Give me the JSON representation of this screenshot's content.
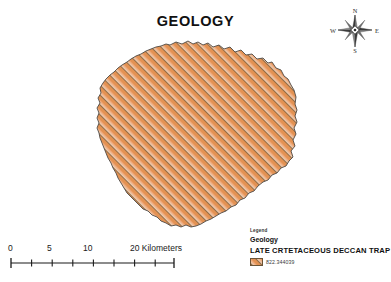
{
  "map": {
    "title": "GEOLOGY",
    "background_color": "#ffffff"
  },
  "compass": {
    "name": "north-arrow",
    "north_label": "N",
    "east_label": "E",
    "south_label": "S",
    "west_label": "W"
  },
  "geology_layer": {
    "class_name": "LATE CRTETACEOUS DECCAN TRAP",
    "fill_color": "#e8a06a",
    "hatch_color": "#8a6a44",
    "outline_color": "#4a4a4a",
    "hatch_angle_degrees": 45
  },
  "scalebar": {
    "unit_label": "Kilometers",
    "ticks": [
      {
        "label": "0",
        "position_px": 0
      },
      {
        "label": "",
        "position_px": 20.6
      },
      {
        "label": "5",
        "position_px": 41.2
      },
      {
        "label": "",
        "position_px": 61.9
      },
      {
        "label": "10",
        "position_px": 82.5
      },
      {
        "label": "",
        "position_px": 103.1
      },
      {
        "label": "",
        "position_px": 123.7
      },
      {
        "label": "",
        "position_px": 144.4
      },
      {
        "label": "20",
        "position_px": 165
      }
    ],
    "labels": [
      {
        "text": "0",
        "left_px": 0
      },
      {
        "text": "5",
        "left_px": 39
      },
      {
        "text": "10",
        "left_px": 77
      },
      {
        "text": "20 Kilometers",
        "left_px": 158
      }
    ]
  },
  "legend": {
    "kicker": "Legend",
    "heading": "Geology",
    "class_label": "LATE CRTETACEOUS DECCAN TRAP",
    "value": "822.344039",
    "swatch_color": "#e8a06a"
  }
}
